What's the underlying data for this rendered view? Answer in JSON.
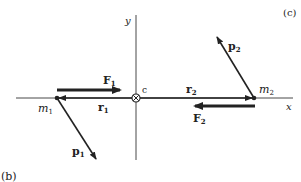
{
  "panel_label_top": "(c)",
  "panel_label_bottom": "(b)",
  "axes": {
    "x_label": "x",
    "y_label": "y"
  },
  "origin": {
    "label": "c"
  },
  "masses": [
    {
      "name": "m",
      "sub": "1"
    },
    {
      "name": "m",
      "sub": "2"
    }
  ],
  "vectors": {
    "F1": {
      "name": "F",
      "sub": "1"
    },
    "F2": {
      "name": "F",
      "sub": "2"
    },
    "r1": {
      "name": "r",
      "sub": "1"
    },
    "r2": {
      "name": "r",
      "sub": "2"
    },
    "p1": {
      "name": "p",
      "sub": "1"
    },
    "p2": {
      "name": "p",
      "sub": "2"
    }
  },
  "colors": {
    "ink": "#222222",
    "background": "#ffffff"
  }
}
